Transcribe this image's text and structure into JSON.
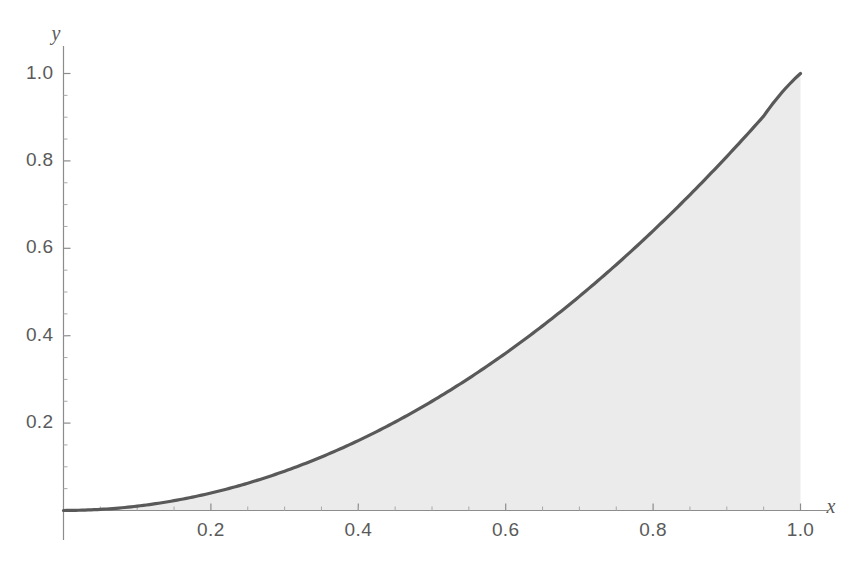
{
  "chart_data": {
    "type": "area",
    "title": "",
    "subtitle": "",
    "xlabel": "x",
    "ylabel": "y",
    "function": "y = x^2",
    "legend": [],
    "annotations": [],
    "grid": false,
    "legend_position": "none",
    "xlim": [
      0,
      1.0
    ],
    "ylim": [
      0,
      1.0
    ],
    "x_ticks": [
      {
        "value": 0.2,
        "label": "0.2"
      },
      {
        "value": 0.4,
        "label": "0.4"
      },
      {
        "value": 0.6,
        "label": "0.6"
      },
      {
        "value": 0.8,
        "label": "0.8"
      },
      {
        "value": 1.0,
        "label": "1.0"
      }
    ],
    "y_ticks": [
      {
        "value": 0.2,
        "label": "0.2"
      },
      {
        "value": 0.4,
        "label": "0.4"
      },
      {
        "value": 0.6,
        "label": "0.6"
      },
      {
        "value": 0.8,
        "label": "0.8"
      },
      {
        "value": 1.0,
        "label": "1.0"
      }
    ],
    "x_minor_tick_count": 4,
    "y_minor_tick_count": 4,
    "series": [
      {
        "name": "y = x^2",
        "type": "area",
        "line_color": "#595959",
        "fill_color": "#ebebeb",
        "line_width": 3.2,
        "x": [
          0.0,
          0.05,
          0.1,
          0.15,
          0.2,
          0.25,
          0.3,
          0.35,
          0.4,
          0.45,
          0.5,
          0.55,
          0.6,
          0.65,
          0.7,
          0.75,
          0.8,
          0.85,
          0.9,
          0.95,
          1.0
        ],
        "values": [
          0.0,
          0.0025,
          0.01,
          0.0225,
          0.04,
          0.0625,
          0.09,
          0.1225,
          0.16,
          0.2025,
          0.25,
          0.3025,
          0.36,
          0.4225,
          0.49,
          0.5625,
          0.64,
          0.7225,
          0.81,
          0.9025,
          1.0
        ]
      }
    ]
  },
  "axes": {
    "x_axis_label": "x",
    "y_axis_label": "y",
    "axis_color": "#808080",
    "tick_text_color": "#5a5a5a"
  },
  "colors": {
    "background": "#ffffff",
    "curve": "#595959",
    "shading": "#ebebeb",
    "axis": "#808080"
  }
}
